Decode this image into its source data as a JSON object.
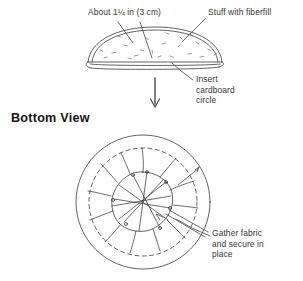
{
  "document": {
    "title": "Pincushion Assembly Diagram",
    "background_color": "#ffffff",
    "ink_color": "#3a3a3a",
    "text_color": "#333333",
    "heading_color": "#161616"
  },
  "headings": {
    "bottom_view": "Bottom View"
  },
  "labels": {
    "height_measure": "About 1¼ in (3 cm)",
    "fiberfill": "Stuff with fiberfill",
    "cardboard": "Insert\ncardboard\ncircle",
    "gather": "Gather fabric\nand secure in\nplace"
  },
  "figures": {
    "side_view": {
      "name": "pincushion-side-profile",
      "description": "Domed pincushion shown in profile with a flat base and thin cardboard disc",
      "dome": {
        "left_x": 88,
        "right_x": 222,
        "base_y": 62,
        "apex_y": 30
      },
      "fill_speck_count": 22
    },
    "flow_arrow": {
      "name": "down-arrow",
      "direction": "down",
      "x": 155,
      "from_y": 78,
      "to_y": 108
    },
    "bottom_view": {
      "name": "pincushion-bottom-view",
      "description": "Circular base seen from below with a dashed stitch circle, radial gathers and crossed securing threads",
      "center_x": 143,
      "center_y": 202,
      "outer_radius": 67,
      "dashed_radius": 54,
      "inner_radius": 30,
      "radial_gather_count": 12,
      "thread_cross_count": 7
    }
  },
  "leaders": [
    {
      "name": "leader-height-left",
      "from": [
        118,
        22
      ],
      "to": [
        133,
        43
      ]
    },
    {
      "name": "leader-height-right",
      "from": [
        140,
        22
      ],
      "to": [
        152,
        58
      ]
    },
    {
      "name": "leader-fiberfill",
      "from": [
        206,
        18
      ],
      "to": [
        182,
        42
      ]
    },
    {
      "name": "leader-cardboard",
      "from": [
        193,
        80
      ],
      "to": [
        172,
        62
      ]
    },
    {
      "name": "leader-gather",
      "from": [
        210,
        235
      ],
      "to": [
        176,
        218
      ]
    }
  ]
}
